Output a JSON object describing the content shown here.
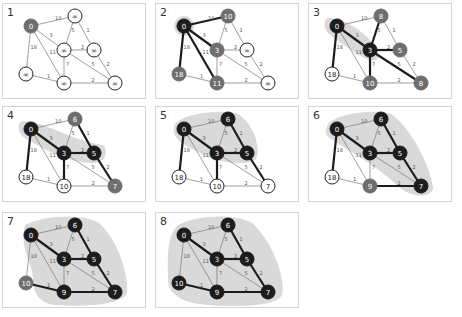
{
  "colors": {
    "visited": "#1c1c1c",
    "frontier": "#6e6e6e",
    "unvisited": "#ffffff",
    "region": "#d9d9d9",
    "edge": "#777777",
    "tree_edge": "#1c1c1c"
  },
  "nodes": [
    {
      "id": "A",
      "x": 28,
      "y": 22
    },
    {
      "id": "B",
      "x": 72,
      "y": 12
    },
    {
      "id": "C",
      "x": 61,
      "y": 46
    },
    {
      "id": "D",
      "x": 91,
      "y": 46
    },
    {
      "id": "E",
      "x": 23,
      "y": 70
    },
    {
      "id": "F",
      "x": 61,
      "y": 79
    },
    {
      "id": "G",
      "x": 112,
      "y": 79
    }
  ],
  "edges": [
    {
      "a": "A",
      "b": "B",
      "w": "10"
    },
    {
      "a": "A",
      "b": "C",
      "w": "3"
    },
    {
      "a": "A",
      "b": "E",
      "w": "18"
    },
    {
      "a": "A",
      "b": "F",
      "w": "11"
    },
    {
      "a": "B",
      "b": "C",
      "w": "5"
    },
    {
      "a": "B",
      "b": "D",
      "w": "1"
    },
    {
      "a": "C",
      "b": "D",
      "w": "2"
    },
    {
      "a": "C",
      "b": "F",
      "w": "7"
    },
    {
      "a": "C",
      "b": "G",
      "w": "5"
    },
    {
      "a": "D",
      "b": "G",
      "w": "2"
    },
    {
      "a": "E",
      "b": "F",
      "w": "1"
    },
    {
      "a": "F",
      "b": "G",
      "w": "2"
    }
  ],
  "panels": [
    {
      "label": "1",
      "x": 2,
      "y": 3,
      "dist": {
        "A": "0",
        "B": "∞",
        "C": "∞",
        "D": "∞",
        "E": "∞",
        "F": "∞",
        "G": "∞"
      },
      "state": {
        "A": "frontier",
        "B": "unvisited",
        "C": "unvisited",
        "D": "unvisited",
        "E": "unvisited",
        "F": "unvisited",
        "G": "unvisited"
      },
      "tree": [],
      "region": ""
    },
    {
      "label": "2",
      "x": 155,
      "y": 3,
      "dist": {
        "A": "0",
        "B": "10",
        "C": "3",
        "D": "∞",
        "E": "18",
        "F": "11",
        "G": "∞"
      },
      "state": {
        "A": "visited",
        "B": "frontier",
        "C": "frontier",
        "D": "unvisited",
        "E": "frontier",
        "F": "frontier",
        "G": "unvisited"
      },
      "tree": [
        "A-B",
        "A-C",
        "A-E",
        "A-F"
      ],
      "region": "M18,22 a10,10 0 1,0 20,0 a10,10 0 1,0 -20,0"
    },
    {
      "label": "3",
      "x": 308,
      "y": 3,
      "dist": {
        "A": "0",
        "B": "8",
        "C": "3",
        "D": "5",
        "E": "18",
        "F": "10",
        "G": "8"
      },
      "state": {
        "A": "visited",
        "B": "frontier",
        "C": "visited",
        "D": "frontier",
        "E": "unvisited",
        "F": "frontier",
        "G": "frontier"
      },
      "tree": [
        "A-E",
        "A-C",
        "C-B",
        "C-D",
        "C-F",
        "C-G"
      ],
      "region": "M20,14 C40,14 72,40 70,54 C62,60 52,54 20,30 C14,24 14,14 20,14 Z"
    },
    {
      "label": "4",
      "x": 2,
      "y": 106,
      "dist": {
        "A": "0",
        "B": "6",
        "C": "3",
        "D": "5",
        "E": "18",
        "F": "10",
        "G": "7"
      },
      "state": {
        "A": "visited",
        "B": "frontier",
        "C": "visited",
        "D": "visited",
        "E": "unvisited",
        "F": "unvisited",
        "G": "frontier"
      },
      "tree": [
        "A-E",
        "A-C",
        "C-D",
        "C-F",
        "D-B",
        "D-G"
      ],
      "region": "M20,14 C40,14 70,34 100,38 C106,44 102,56 92,56 C70,56 50,48 20,30 C14,24 14,14 20,14 Z"
    },
    {
      "label": "5",
      "x": 155,
      "y": 106,
      "dist": {
        "A": "0",
        "B": "6",
        "C": "3",
        "D": "5",
        "E": "18",
        "F": "10",
        "G": "7"
      },
      "state": {
        "A": "visited",
        "B": "visited",
        "C": "visited",
        "D": "visited",
        "E": "unvisited",
        "F": "unvisited",
        "G": "unvisited"
      },
      "tree": [
        "A-E",
        "A-C",
        "C-D",
        "C-F",
        "D-B",
        "D-G"
      ],
      "region": "M18,20 C20,8 60,2 80,6 C96,14 106,40 100,52 C90,60 60,56 40,44 C24,36 16,30 18,20 Z"
    },
    {
      "label": "6",
      "x": 308,
      "y": 106,
      "dist": {
        "A": "0",
        "B": "6",
        "C": "3",
        "D": "5",
        "E": "18",
        "F": "9",
        "G": "7"
      },
      "state": {
        "A": "visited",
        "B": "visited",
        "C": "visited",
        "D": "visited",
        "E": "unvisited",
        "F": "frontier",
        "G": "visited"
      },
      "tree": [
        "A-E",
        "A-C",
        "C-D",
        "D-B",
        "D-G",
        "G-F"
      ],
      "region": "M18,20 C20,8 60,2 80,6 C100,16 124,64 124,82 C120,92 102,90 90,80 C70,60 40,44 22,32 C16,28 16,24 18,20 Z"
    },
    {
      "label": "7",
      "x": 2,
      "y": 212,
      "dist": {
        "A": "0",
        "B": "6",
        "C": "3",
        "D": "5",
        "E": "10",
        "F": "9",
        "G": "7"
      },
      "state": {
        "A": "visited",
        "B": "visited",
        "C": "visited",
        "D": "visited",
        "E": "frontier",
        "F": "visited",
        "G": "visited"
      },
      "tree": [
        "A-C",
        "C-D",
        "D-B",
        "D-G",
        "G-F",
        "F-E"
      ],
      "region": "M22,12 C40,2 80,0 96,10 C116,28 126,64 124,80 C120,92 80,94 52,92 C36,90 30,80 30,66 C30,50 16,36 22,12 Z"
    },
    {
      "label": "8",
      "x": 155,
      "y": 212,
      "dist": {
        "A": "0",
        "B": "6",
        "C": "3",
        "D": "5",
        "E": "10",
        "F": "9",
        "G": "7"
      },
      "state": {
        "A": "visited",
        "B": "visited",
        "C": "visited",
        "D": "visited",
        "E": "visited",
        "F": "visited",
        "G": "visited"
      },
      "tree": [
        "A-C",
        "C-D",
        "D-B",
        "D-G",
        "G-F",
        "F-E"
      ],
      "region": "M22,12 C40,2 80,0 96,10 C116,28 130,64 126,82 C120,94 80,94 52,92 C30,90 12,84 12,66 C12,46 10,24 22,12 Z"
    }
  ]
}
